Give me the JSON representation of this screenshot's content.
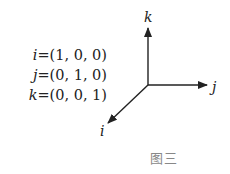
{
  "equations": [
    {
      "var": "i",
      "value": "=(1, 0, 0)"
    },
    {
      "var": "j",
      "value": "=(0, 1, 0)"
    },
    {
      "var": "k",
      "value": "=(0, 0, 1)"
    }
  ],
  "axes": {
    "k_label": "k",
    "j_label": "j",
    "i_label": "i"
  },
  "caption": "图三",
  "colors": {
    "line": "#222222",
    "caption": "#888888"
  }
}
